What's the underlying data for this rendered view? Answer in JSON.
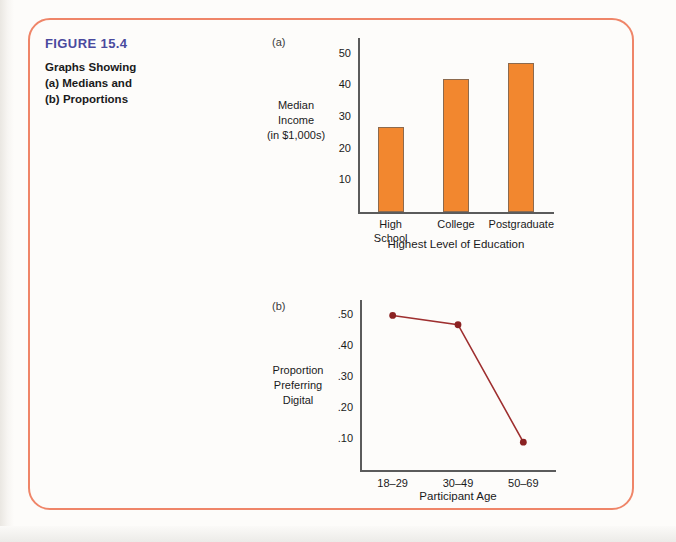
{
  "figure": {
    "number_label": "FIGURE 15.4",
    "caption_lines": [
      "Graphs Showing",
      "(a) Medians and",
      "(b) Proportions"
    ],
    "frame_color": "#ef8568",
    "number_color": "#4a4a9e"
  },
  "chart_data": [
    {
      "panel_label": "(a)",
      "type": "bar",
      "title": "",
      "categories": [
        "High\nSchool",
        "College",
        "Postgraduate"
      ],
      "values": [
        27,
        42,
        47
      ],
      "xlabel": "Highest Level of Education",
      "ylabel": "Median\nIncome\n(in $1,000s)",
      "ylabel_lines": [
        "Median",
        "Income",
        "(in $1,000s)"
      ],
      "yticks": [
        10,
        20,
        30,
        40,
        50
      ],
      "ytick_labels": [
        "10",
        "20",
        "30",
        "40",
        "50"
      ],
      "ylim": [
        0,
        55
      ],
      "grid": false,
      "legend": "none",
      "bar_color": "#f2872f",
      "bar_edge_color": "#8c6a4e"
    },
    {
      "panel_label": "(b)",
      "type": "line",
      "title": "",
      "categories": [
        "18–29",
        "30–49",
        "50–69"
      ],
      "values": [
        0.5,
        0.47,
        0.09
      ],
      "xlabel": "Participant Age",
      "ylabel": "Proportion\nPreferring\nDigital",
      "ylabel_lines": [
        "Proportion",
        "Preferring",
        "Digital"
      ],
      "yticks": [
        0.1,
        0.2,
        0.3,
        0.4,
        0.5
      ],
      "ytick_labels": [
        ".10",
        ".20",
        ".30",
        ".40",
        ".50"
      ],
      "ylim": [
        0,
        0.55
      ],
      "grid": false,
      "legend": "none",
      "line_color": "#9e2f2f",
      "marker_color": "#8b2222",
      "marker": "circle"
    }
  ]
}
